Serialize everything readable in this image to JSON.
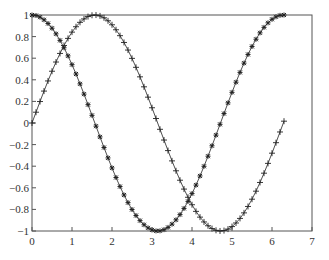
{
  "chart_data": {
    "type": "line",
    "title": "",
    "xlabel": "",
    "ylabel": "",
    "xlim": [
      0,
      7
    ],
    "ylim": [
      -1,
      1
    ],
    "grid": false,
    "legend": null,
    "xticks": [
      "0",
      "1",
      "2",
      "3",
      "4",
      "5",
      "6",
      "7"
    ],
    "yticks": [
      "1",
      "0.8",
      "0.6",
      "0.4",
      "0.2",
      "0",
      "-0.2",
      "-0.4",
      "-0.6",
      "-0.8",
      "-1"
    ],
    "x": {
      "start": 0,
      "stop": 6.3,
      "step": 0.1
    },
    "series": [
      {
        "name": "cos(x)",
        "function": "cos",
        "marker": "*",
        "color": "#222222"
      },
      {
        "name": "sin(x)",
        "function": "sin",
        "marker": "+",
        "color": "#222222"
      }
    ]
  }
}
